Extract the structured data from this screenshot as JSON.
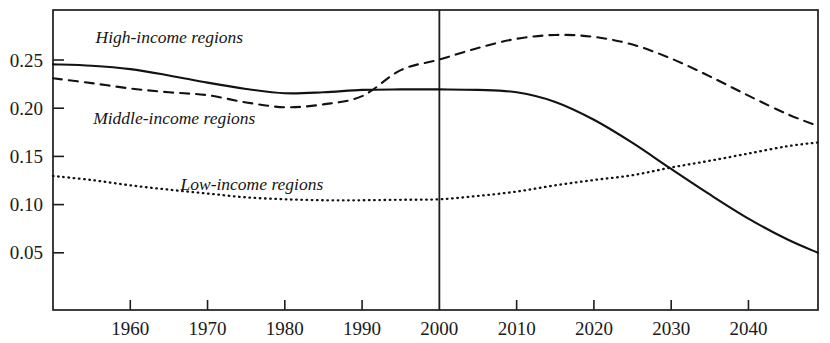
{
  "chart_data": {
    "type": "line",
    "title": "",
    "subtitle": "",
    "xlabel": "",
    "ylabel": "",
    "xlim": [
      1950,
      2049
    ],
    "ylim": [
      0.0,
      0.287
    ],
    "grid": false,
    "legend_position": "inline-annotations",
    "x_ticks": [
      1960,
      1970,
      1980,
      1990,
      2000,
      2010,
      2020,
      2030,
      2040
    ],
    "x_tick_labels": [
      "1960",
      "1970",
      "1980",
      "1990",
      "2000",
      "2010",
      "2020",
      "2030",
      "2040"
    ],
    "y_ticks": [
      0.05,
      0.1,
      0.15,
      0.2,
      0.25
    ],
    "y_tick_labels": [
      "0.05",
      "0.10",
      "0.15",
      "0.20",
      "0.25"
    ],
    "annotations": [
      {
        "text": "High-income regions",
        "x": 1955.5,
        "y": 0.268,
        "series": "high-income"
      },
      {
        "text": "Middle-income regions",
        "x": 1955.2,
        "y": 0.184,
        "series": "middle-income"
      },
      {
        "text": "Low-income regions",
        "x": 1966.5,
        "y": 0.1155,
        "series": "low-income"
      }
    ],
    "reference_line": {
      "x": 2000,
      "orientation": "vertical",
      "label": ""
    },
    "x": [
      1950,
      1955,
      1960,
      1965,
      1970,
      1975,
      1980,
      1985,
      1990,
      1995,
      2000,
      2005,
      2010,
      2015,
      2020,
      2025,
      2030,
      2035,
      2040,
      2045,
      2049
    ],
    "series": [
      {
        "name": "High-income regions",
        "style": "solid",
        "values": [
          0.2455,
          0.244,
          0.2405,
          0.234,
          0.2265,
          0.22,
          0.2155,
          0.2165,
          0.219,
          0.2195,
          0.2195,
          0.219,
          0.2165,
          0.2065,
          0.188,
          0.164,
          0.137,
          0.1105,
          0.0855,
          0.064,
          0.05
        ]
      },
      {
        "name": "Middle-income regions",
        "style": "dashed",
        "values": [
          0.231,
          0.226,
          0.2205,
          0.2165,
          0.2135,
          0.206,
          0.201,
          0.204,
          0.2125,
          0.2395,
          0.2505,
          0.2625,
          0.272,
          0.276,
          0.274,
          0.266,
          0.2515,
          0.233,
          0.213,
          0.194,
          0.1815
        ]
      },
      {
        "name": "Low-income regions",
        "style": "dotted",
        "values": [
          0.1297,
          0.1255,
          0.12,
          0.1155,
          0.1115,
          0.1075,
          0.1055,
          0.1045,
          0.1045,
          0.105,
          0.1055,
          0.109,
          0.1135,
          0.12,
          0.1255,
          0.1305,
          0.1385,
          0.1455,
          0.153,
          0.1605,
          0.1645
        ]
      }
    ]
  },
  "axes": {
    "frame": {
      "left_px": 53,
      "right_px": 818,
      "top_px": 10,
      "bottom_px": 310
    }
  },
  "colors": {
    "ink": "#121212",
    "background": "#ffffff"
  }
}
